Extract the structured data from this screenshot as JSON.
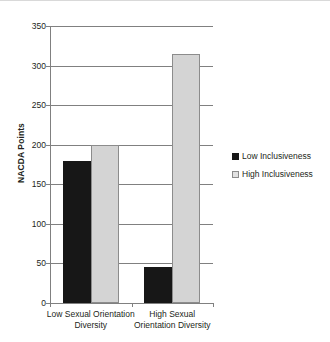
{
  "chart_data": {
    "type": "bar",
    "title": "",
    "subtitle": "",
    "xlabel": "",
    "ylabel": "NACDA Points",
    "ylim": [
      0,
      350
    ],
    "yticks": [
      0,
      50,
      100,
      150,
      200,
      250,
      300,
      350
    ],
    "ytick_labels": [
      "0",
      "50",
      "100",
      "150",
      "200",
      "250",
      "300",
      "350"
    ],
    "grid": true,
    "legend_position": "right",
    "categories": [
      "Low Sexual Orientation Diversity",
      "High Sexual Orientation Diversity"
    ],
    "category_lines": [
      [
        "Low Sexual Orientation",
        "Diversity"
      ],
      [
        "High Sexual",
        "Orientation Diversity"
      ]
    ],
    "series": [
      {
        "name": "Low Inclusiveness",
        "color": "#171717",
        "values": [
          180,
          46
        ]
      },
      {
        "name": "High Inclusiveness",
        "color": "#d4d4d4",
        "values": [
          200,
          315
        ]
      }
    ]
  },
  "legend": {
    "entries": [
      {
        "label": "Low Inclusiveness",
        "swatch": "low-inclusiveness-swatch"
      },
      {
        "label": "High Inclusiveness",
        "swatch": "high-inclusiveness-swatch"
      }
    ]
  },
  "axes": {
    "y_title": "NACDA Points"
  }
}
